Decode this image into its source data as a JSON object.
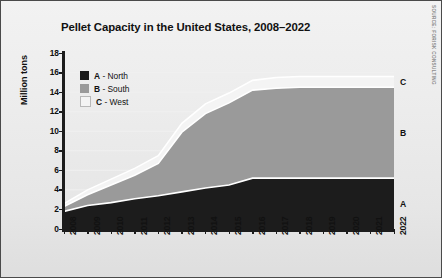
{
  "figure": {
    "title": "Pellet Capacity in the United States, 2008–2022",
    "source_note": "SOURCE: FORISK CONSULTING",
    "background_top_color": "#f2f2f2",
    "background_bottom_color": "#dedede",
    "border_color": "#4a4a4a"
  },
  "legend": {
    "items": [
      {
        "key": "A",
        "separator": "-",
        "label": "North",
        "color": "#1c1c1c"
      },
      {
        "key": "B",
        "separator": "-",
        "label": "South",
        "color": "#9a9a9a"
      },
      {
        "key": "C",
        "separator": "-",
        "label": "West",
        "color": "#f4f4f4"
      }
    ]
  },
  "band_labels": [
    {
      "name": "C",
      "text": "C"
    },
    {
      "name": "B",
      "text": "B"
    },
    {
      "name": "A",
      "text": "A"
    }
  ],
  "chart_data": {
    "type": "area",
    "stacked": true,
    "title": "Pellet Capacity in the United States, 2008–2022",
    "xlabel": "",
    "ylabel": "Million tons",
    "ylim": [
      0,
      18
    ],
    "ytick_step": 2,
    "yticks": [
      0,
      2,
      4,
      6,
      8,
      10,
      12,
      14,
      16,
      18
    ],
    "grid": true,
    "grid_color": "#f0f0f0",
    "legend_position": "upper-left-inside",
    "categories": [
      2008,
      2009,
      2010,
      2011,
      2012,
      2013,
      2014,
      2015,
      2016,
      2017,
      2018,
      2019,
      2020,
      2021,
      2022
    ],
    "series": [
      {
        "name": "A - North",
        "key": "A",
        "label": "North",
        "color": "#1c1c1c",
        "values": [
          1.8,
          2.4,
          2.7,
          3.1,
          3.4,
          3.8,
          4.2,
          4.5,
          5.2,
          5.2,
          5.2,
          5.2,
          5.2,
          5.2,
          5.2
        ]
      },
      {
        "name": "B - South",
        "key": "B",
        "label": "South",
        "color": "#9a9a9a",
        "values": [
          0.5,
          1.1,
          1.8,
          2.4,
          3.3,
          6.1,
          7.6,
          8.4,
          9.0,
          9.2,
          9.3,
          9.3,
          9.3,
          9.3,
          9.3
        ]
      },
      {
        "name": "C - West",
        "key": "C",
        "label": "West",
        "color": "#f4f4f4",
        "values": [
          0.3,
          0.5,
          0.6,
          0.7,
          0.8,
          0.9,
          1.0,
          1.0,
          1.0,
          1.1,
          1.1,
          1.1,
          1.1,
          1.1,
          1.1
        ]
      }
    ],
    "totals": [
      2.6,
      4.0,
      5.1,
      6.2,
      7.5,
      10.8,
      12.8,
      13.9,
      15.2,
      15.5,
      15.6,
      15.6,
      15.6,
      15.6,
      15.6
    ]
  }
}
